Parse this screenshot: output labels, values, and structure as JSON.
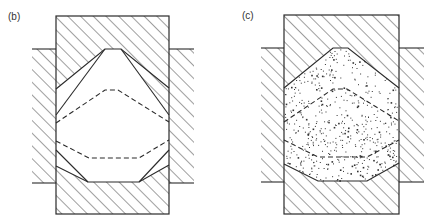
{
  "panels": [
    {
      "id": "b",
      "label": "(b)",
      "fill": "empty",
      "description": "Die cavity cross-section with hatched die blocks, showing two solid contour profiles and two dashed intermediate profiles"
    },
    {
      "id": "c",
      "label": "(c)",
      "fill": "stippled",
      "description": "Die cavity cross-section with hatched die blocks, cavity filled with stippled material, showing dashed intermediate profiles"
    }
  ],
  "colors": {
    "line": "#2a2a2a",
    "background": "#ffffff",
    "stipple": "#333333"
  }
}
